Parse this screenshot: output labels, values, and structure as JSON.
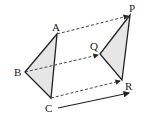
{
  "diagram": {
    "triangle_original": {
      "vertices": {
        "A": {
          "label": "A",
          "x": 57,
          "y": 34
        },
        "B": {
          "label": "B",
          "x": 25,
          "y": 72
        },
        "C": {
          "label": "C",
          "x": 51,
          "y": 98
        }
      }
    },
    "triangle_image": {
      "vertices": {
        "P": {
          "label": "P",
          "x": 130,
          "y": 15
        },
        "Q": {
          "label": "Q",
          "x": 100,
          "y": 54
        },
        "R": {
          "label": "R",
          "x": 122,
          "y": 80
        }
      }
    },
    "correspondences": [
      {
        "from": "A",
        "to": "P"
      },
      {
        "from": "B",
        "to": "Q"
      },
      {
        "from": "C",
        "to": "R"
      }
    ],
    "translation_vector": {
      "x1": 58,
      "y1": 108,
      "x2": 130,
      "y2": 93
    },
    "colors": {
      "fill": "#e6e6e6",
      "stroke": "#222222",
      "dashed": "#333333"
    }
  }
}
